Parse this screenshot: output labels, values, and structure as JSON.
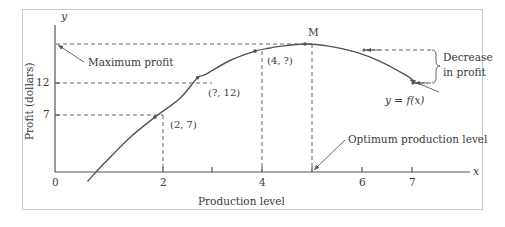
{
  "chart_data": {
    "type": "line",
    "title": "",
    "xlabel": "Production level",
    "ylabel": "Profit (dollars)",
    "x_axis_name": "x",
    "y_axis_name": "y",
    "xlim": [
      0,
      7.6
    ],
    "ylim": [
      0,
      17.5
    ],
    "grid": false,
    "legend": "none",
    "x_ticks": [
      "0",
      "2",
      "4",
      "6",
      "7"
    ],
    "x_tick_values": [
      0,
      2,
      4,
      6,
      7
    ],
    "y_ticks": [
      "7",
      "12"
    ],
    "y_tick_values": [
      7,
      12
    ],
    "series": [
      {
        "name": "y = f(x)",
        "equation_label": "y = f(x)",
        "description": "Concave-down parabola of profit versus production level, peaking at x = 5",
        "x": [
          0.65,
          1,
          1.5,
          2,
          2.5,
          2.85,
          3,
          3.5,
          4,
          4.3,
          4.5,
          5,
          5.5,
          6,
          6.5,
          7,
          7.2
        ],
        "y": [
          -1.2,
          1.2,
          4.4,
          7,
          9.4,
          12,
          12.4,
          14.2,
          15.4,
          15.8,
          16.0,
          16.3,
          16.0,
          15.3,
          14.1,
          12.4,
          11.5
        ]
      }
    ],
    "points": [
      {
        "label": "(2, 7)",
        "x": 2,
        "y": 7
      },
      {
        "label": "(?, 12)",
        "x": 2.85,
        "y": 12
      },
      {
        "label": "(4, ?)",
        "x": 4,
        "y": 15.4
      },
      {
        "label": "M",
        "x": 5,
        "y": 16.3
      }
    ],
    "annotations": [
      {
        "name": "maximum-profit",
        "text": "Maximum profit"
      },
      {
        "name": "optimum-production-level",
        "text": "Optimum production level"
      },
      {
        "name": "decrease-in-profit-line1",
        "text": "Decrease"
      },
      {
        "name": "decrease-in-profit-line2",
        "text": "in profit"
      }
    ],
    "colors": {
      "curve": "#555555",
      "axis": "#555555",
      "dashed": "#666666",
      "text": "#3a3a3a",
      "frame": "#c9c9c9",
      "background": "#ffffff"
    }
  }
}
